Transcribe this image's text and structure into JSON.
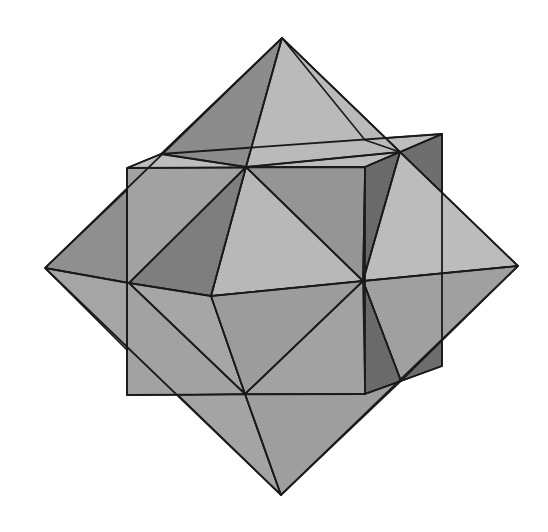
{
  "figure": {
    "shading": {
      "light": "#b9b9b9",
      "mid": "#a3a3a3",
      "medium_dark": "#8f8f8f",
      "dark": "#747474",
      "darkest": "#5e5e5e",
      "edge": "#1a1a1a",
      "background": "#ffffff"
    },
    "vertices": {
      "oct_top": [
        282,
        38
      ],
      "oct_bottom": [
        281,
        495
      ],
      "oct_left": [
        45,
        268
      ],
      "oct_right": [
        518,
        266
      ],
      "oct_front_tl": [
        246,
        167
      ],
      "oct_back_tr": [
        400,
        152
      ],
      "oct_mid_left": [
        129,
        283
      ],
      "oct_center": [
        211,
        296
      ],
      "oct_mid_right": [
        363,
        281
      ],
      "oct_front_bl": [
        245,
        394
      ],
      "oct_back_br": [
        401,
        381
      ],
      "cube_ftl": [
        127,
        168
      ],
      "cube_ftr": [
        365,
        167
      ],
      "cube_fbl": [
        127,
        395
      ],
      "cube_fbr": [
        365,
        394
      ],
      "cube_btl": [
        161,
        154
      ],
      "cube_btr": [
        442,
        134
      ],
      "cube_bbr": [
        442,
        366
      ]
    }
  }
}
